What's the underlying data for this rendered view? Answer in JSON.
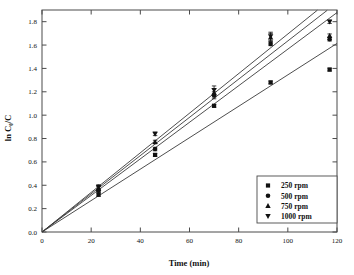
{
  "chart_data": {
    "type": "scatter",
    "title": "",
    "xlabel": "Time (min)",
    "ylabel": "ln C₀/C",
    "xlim": [
      0,
      120
    ],
    "ylim": [
      0.0,
      1.9
    ],
    "xticks": [
      0,
      20,
      40,
      60,
      80,
      100,
      120
    ],
    "xtick_labels": [
      "0",
      "20",
      "40",
      "60",
      "80",
      "100",
      "120"
    ],
    "yticks": [
      0.0,
      0.2,
      0.4,
      0.6,
      0.8,
      1.0,
      1.2,
      1.4,
      1.6,
      1.8
    ],
    "ytick_labels": [
      "0.0",
      "0.2",
      "0.4",
      "0.6",
      "0.8",
      "1.0",
      "1.2",
      "1.4",
      "1.6",
      "1.8"
    ],
    "grid": false,
    "legend_position": "lower right",
    "series": [
      {
        "name": "250 rpm",
        "marker": "square",
        "color": "#111111",
        "x": [
          0,
          23,
          46,
          70,
          93,
          117
        ],
        "y": [
          0.0,
          0.32,
          0.66,
          1.08,
          1.28,
          1.39
        ],
        "yerr": [
          0.0,
          0.015,
          0.012,
          0.012,
          0.012,
          0.012
        ],
        "fit_line": {
          "slope": 0.01345,
          "intercept": 0.0,
          "x_end": 120,
          "y_end": 1.614
        }
      },
      {
        "name": "500 rpm",
        "marker": "circle",
        "color": "#111111",
        "x": [
          0,
          23,
          46,
          70,
          93,
          117
        ],
        "y": [
          0.0,
          0.355,
          0.71,
          1.17,
          1.61,
          1.65
        ],
        "yerr": [
          0.0,
          0.02,
          0.015,
          0.03,
          0.015,
          0.015
        ],
        "fit_line": {
          "slope": 0.01565,
          "intercept": 0.0,
          "x_end": 120,
          "y_end": 1.878
        }
      },
      {
        "name": "750 rpm",
        "marker": "triangle-up",
        "color": "#111111",
        "x": [
          0,
          23,
          46,
          70,
          93,
          117
        ],
        "y": [
          0.0,
          0.37,
          0.77,
          1.19,
          1.665,
          1.68
        ],
        "yerr": [
          0.0,
          0.02,
          0.015,
          0.035,
          0.035,
          0.015
        ],
        "fit_line": {
          "slope": 0.01635,
          "intercept": 0.0,
          "x_end": 116,
          "y_end": 1.897
        }
      },
      {
        "name": "1000 rpm",
        "marker": "triangle-down",
        "color": "#111111",
        "x": [
          0,
          23,
          46,
          70,
          93,
          117
        ],
        "y": [
          0.0,
          0.385,
          0.84,
          1.215,
          1.675,
          1.8
        ],
        "yerr": [
          0.0,
          0.02,
          0.015,
          0.035,
          0.035,
          0.015
        ],
        "fit_line": {
          "slope": 0.01695,
          "intercept": 0.0,
          "x_end": 112,
          "y_end": 1.898
        }
      }
    ]
  },
  "legend": {
    "entries": [
      {
        "label": "250 rpm",
        "marker": "square"
      },
      {
        "label": "500 rpm",
        "marker": "circle"
      },
      {
        "label": "750 rpm",
        "marker": "triangle-up"
      },
      {
        "label": "1000 rpm",
        "marker": "triangle-down"
      }
    ]
  },
  "colors": {
    "ink": "#111111",
    "line": "#3a3a3a",
    "frame": "#4a4a4a",
    "background": "#ffffff"
  }
}
